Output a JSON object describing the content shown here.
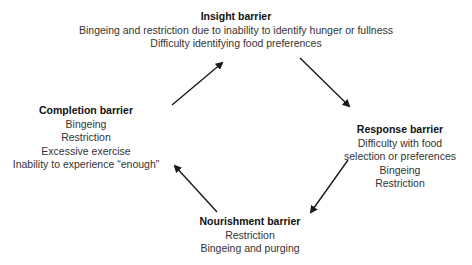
{
  "diagram": {
    "nodes": {
      "insight": {
        "title": "Insight barrier",
        "lines": [
          "Bingeing and restriction due to inability to identify hunger or fullness",
          "Difficulty identifying food preferences"
        ]
      },
      "response": {
        "title": "Response barrier",
        "lines": [
          "Difficulty with food",
          "selection or preferences",
          "Bingeing",
          "Restriction"
        ]
      },
      "nourishment": {
        "title": "Nourishment barrier",
        "lines": [
          "Restriction",
          "Bingeing and purging"
        ]
      },
      "completion": {
        "title": "Completion barrier",
        "lines": [
          "Bingeing",
          "Restriction",
          "Excessive exercise",
          "Inability to experience “enough”"
        ]
      }
    },
    "edges": [
      {
        "from": "completion",
        "to": "insight"
      },
      {
        "from": "insight",
        "to": "response"
      },
      {
        "from": "response",
        "to": "nourishment"
      },
      {
        "from": "nourishment",
        "to": "completion"
      }
    ],
    "colors": {
      "arrow": "#1a1a1a",
      "text": "#333333",
      "background": "#ffffff"
    }
  }
}
